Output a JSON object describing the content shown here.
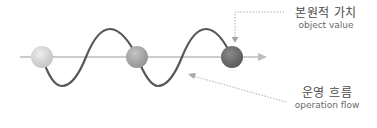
{
  "labels": {
    "object_value": {
      "ko": "본원적 가치",
      "en": "object value"
    },
    "operation_flow": {
      "ko": "운영 흐름",
      "en": "operation flow"
    }
  },
  "colors": {
    "axis": "#b8b8b8",
    "wave": "#555555",
    "callout": "#b0b0b0",
    "sphere_light": "#d6d6d6",
    "sphere_mid": "#a9a9a9",
    "sphere_dark": "#6f6f6f"
  },
  "spheres": [
    {
      "name": "sphere-1",
      "tone": "light"
    },
    {
      "name": "sphere-2",
      "tone": "mid"
    },
    {
      "name": "sphere-3",
      "tone": "dark"
    }
  ]
}
